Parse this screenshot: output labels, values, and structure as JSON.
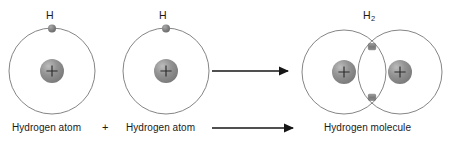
{
  "diagram": {
    "title_visible": false,
    "left_atom": {
      "symbol": "H",
      "nucleus_charge": "+",
      "caption": "Hydrogen atom"
    },
    "right_atom": {
      "symbol": "H",
      "nucleus_charge": "+",
      "caption": "Hydrogen atom"
    },
    "operator": "+",
    "molecule": {
      "symbol_element": "H",
      "symbol_subscript": "2",
      "nucleus_charge_left": "+",
      "nucleus_charge_right": "+",
      "caption": "Hydrogen molecule"
    },
    "colors": {
      "background": "#ffffff",
      "orbit_stroke": "#6f6f6f",
      "nucleus_fill": "#8d8d8d",
      "nucleus_highlight": "#b9b9b9",
      "nucleus_shadow": "#6e6e6e",
      "electron_fill": "#7b7b7b",
      "arrow_stroke": "#161616",
      "text": "#1a1a1a"
    },
    "geometry": {
      "left_atom_center_x": 52,
      "left_atom_center_y": 71,
      "right_atom_center_x": 166,
      "right_atom_center_y": 71,
      "orbit_radius": 43,
      "nucleus_radius": 12,
      "electron_radius": 4,
      "molecule_left_center_x": 344,
      "molecule_right_center_x": 400,
      "molecule_center_y": 72,
      "molecule_orbit_radius": 42
    },
    "arrows": [
      {
        "name": "reaction-arrow-top",
        "x1": 212,
        "y1": 71,
        "x2": 291,
        "y2": 71
      },
      {
        "name": "reaction-arrow-bottom",
        "x1": 212,
        "y1": 128,
        "x2": 296,
        "y2": 128
      }
    ]
  }
}
